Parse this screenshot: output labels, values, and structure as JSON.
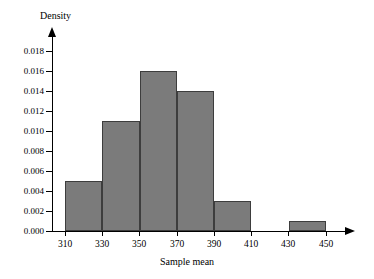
{
  "chart_data": {
    "type": "bar",
    "title": "",
    "subtitle": "",
    "xlabel": "Sample mean",
    "ylabel": "Density",
    "grid": false,
    "legend": "none",
    "histogram": true,
    "bin_width": 20,
    "xlim": [
      300,
      460
    ],
    "ylim": [
      0.0,
      0.019
    ],
    "x_ticks": [
      "310",
      "330",
      "350",
      "370",
      "390",
      "410",
      "430",
      "450"
    ],
    "x_tick_values": [
      310,
      330,
      350,
      370,
      390,
      410,
      430,
      450
    ],
    "y_ticks": [
      "0.000",
      "0.002",
      "0.004",
      "0.006",
      "0.008",
      "0.010",
      "0.012",
      "0.014",
      "0.016",
      "0.018"
    ],
    "y_tick_values": [
      0.0,
      0.002,
      0.004,
      0.006,
      0.008,
      0.01,
      0.012,
      0.014,
      0.016,
      0.018
    ],
    "categories": [
      "310-330",
      "330-350",
      "350-370",
      "370-390",
      "390-410",
      "410-430",
      "430-450"
    ],
    "bins": [
      {
        "start": 310,
        "end": 330,
        "density": 0.005
      },
      {
        "start": 330,
        "end": 350,
        "density": 0.011
      },
      {
        "start": 350,
        "end": 370,
        "density": 0.016
      },
      {
        "start": 370,
        "end": 390,
        "density": 0.014
      },
      {
        "start": 390,
        "end": 410,
        "density": 0.003
      },
      {
        "start": 410,
        "end": 430,
        "density": 0.0
      },
      {
        "start": 430,
        "end": 450,
        "density": 0.001
      }
    ],
    "values": [
      0.005,
      0.011,
      0.016,
      0.014,
      0.003,
      0.0,
      0.001
    ],
    "colors": {
      "bar_fill": "#7b7b7b",
      "bar_edge": "#3d3d3d",
      "axis": "#000000",
      "background": "#ffffff"
    }
  }
}
